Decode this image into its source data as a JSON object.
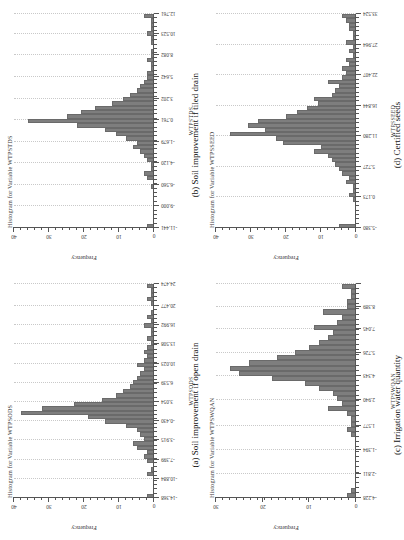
{
  "figure": {
    "panels": [
      {
        "key": "a",
        "title": "Histogram for Variable WTPSODS",
        "caption": "(a) Soil improvement if open drain",
        "chart_data": {
          "type": "bar",
          "title": "Histogram for Variable WTPSODS",
          "xlabel": "WTPSODS",
          "ylabel": "Frequency",
          "ylim": [
            0,
            40
          ],
          "yticks": [
            0,
            10,
            20,
            30,
            40
          ],
          "grid": true,
          "xlim": [
            -14.368,
            24.474
          ],
          "xticks": [
            -14.368,
            -10.884,
            -7.399,
            -3.915,
            -0.43,
            3.054,
            6.539,
            10.023,
            13.508,
            16.992,
            20.477,
            24.474
          ],
          "xticklabels": [
            "-14.368",
            "-10.884",
            "-7.399",
            "-3.915",
            "-0.430",
            "3.054",
            "6.539",
            "10.023",
            "13.508",
            "16.992",
            "20.477",
            "24.474"
          ],
          "categories": [
            "-14.2",
            "-13.4",
            "-12.6",
            "-11.8",
            "-11.0",
            "-10.2",
            "-9.4",
            "-8.6",
            "-7.8",
            "-7.0",
            "-6.2",
            "-5.4",
            "-4.6",
            "-3.8",
            "-3.0",
            "-2.2",
            "-1.4",
            "-0.6",
            "0.2",
            "1.0",
            "1.8",
            "2.6",
            "3.4",
            "4.2",
            "5.0",
            "5.8",
            "6.6",
            "7.4",
            "8.2",
            "9.0",
            "9.8",
            "10.6",
            "11.4",
            "12.2",
            "13.0",
            "13.8",
            "14.6",
            "15.4",
            "16.2",
            "17.0",
            "17.8",
            "18.6",
            "19.4",
            "20.2",
            "21.0",
            "21.8",
            "22.6",
            "23.4",
            "24.2"
          ],
          "values": [
            2,
            0,
            0,
            0,
            0,
            2,
            1,
            0,
            2,
            3,
            2,
            5,
            6,
            3,
            4,
            5,
            8,
            14,
            19,
            38,
            32,
            23,
            15,
            11,
            9,
            7,
            6,
            5,
            4,
            3,
            5,
            3,
            2,
            3,
            2,
            1,
            2,
            1,
            1,
            3,
            1,
            2,
            1,
            0,
            1,
            2,
            1,
            1,
            2
          ]
        }
      },
      {
        "key": "b",
        "title": "Histogram for Variable WTPSTDS",
        "caption": "(b) Soil improvement if tiled drain",
        "chart_data": {
          "type": "bar",
          "title": "Histogram for Variable WTPSTDS",
          "xlabel": "WTPSTDS",
          "ylabel": "Frequency",
          "ylim": [
            0,
            40
          ],
          "yticks": [
            0,
            10,
            20,
            30,
            40
          ],
          "grid": true,
          "xlim": [
            -11.441,
            12.761
          ],
          "xticks": [
            -11.441,
            -9.0,
            -6.56,
            -4.12,
            -1.679,
            0.761,
            3.202,
            5.642,
            8.082,
            10.523,
            12.761
          ],
          "xticklabels": [
            "-11.441",
            "-9.000",
            "-6.560",
            "-4.120",
            "-1.679",
            "0.761",
            "3.202",
            "5.642",
            "8.082",
            "10.523",
            "12.761"
          ],
          "categories": [
            "-11.2",
            "-10.7",
            "-10.2",
            "-9.7",
            "-9.2",
            "-8.7",
            "-8.2",
            "-7.7",
            "-7.2",
            "-6.7",
            "-6.2",
            "-5.7",
            "-5.2",
            "-4.7",
            "-4.2",
            "-3.7",
            "-3.2",
            "-2.7",
            "-2.2",
            "-1.7",
            "-1.2",
            "-0.7",
            "-0.2",
            "0.3",
            "0.8",
            "1.3",
            "1.8",
            "2.3",
            "2.8",
            "3.3",
            "3.8",
            "4.3",
            "4.8",
            "5.3",
            "5.8",
            "6.3",
            "6.8",
            "7.3",
            "7.8",
            "8.3",
            "8.8",
            "9.3",
            "9.8",
            "10.3",
            "10.8",
            "11.3",
            "11.8",
            "12.3",
            "12.7"
          ],
          "values": [
            2,
            0,
            0,
            0,
            0,
            0,
            0,
            0,
            0,
            1,
            0,
            2,
            3,
            1,
            1,
            2,
            3,
            4,
            6,
            5,
            8,
            11,
            14,
            22,
            36,
            25,
            21,
            17,
            12,
            9,
            7,
            5,
            4,
            3,
            2,
            2,
            1,
            1,
            2,
            1,
            1,
            0,
            1,
            1,
            2,
            1,
            1,
            1,
            3
          ]
        }
      },
      {
        "key": "c",
        "title": "Histogram for Variable WTPSWQAN",
        "caption": "(c) Irrigation water quantity",
        "chart_data": {
          "type": "bar",
          "title": "Histogram for Variable WTPSWQAN",
          "xlabel": "WTPSWQAN",
          "ylabel": "Frequency",
          "ylim": [
            0,
            30
          ],
          "yticks": [
            0,
            10,
            20,
            30
          ],
          "grid": true,
          "xlim": [
            -4.228,
            8.389
          ],
          "xticks": [
            -4.228,
            -2.811,
            -1.394,
            0.023,
            1.577,
            2.94,
            4.343,
            5.726,
            7.045,
            8.389
          ],
          "xticklabels": [
            "-4.228",
            "-2.811",
            "-1.394",
            "1.577",
            "2.940",
            "4.343",
            "5.726",
            "7.045",
            "8.389"
          ],
          "categories": [
            "-4.1",
            "-3.8",
            "-3.5",
            "-3.2",
            "-2.9",
            "-2.6",
            "-2.3",
            "-2.0",
            "-1.7",
            "-1.4",
            "-1.1",
            "-0.8",
            "-0.5",
            "-0.2",
            "0.1",
            "0.4",
            "0.7",
            "1.0",
            "1.3",
            "1.6",
            "1.9",
            "2.2",
            "2.5",
            "2.8",
            "3.1",
            "3.4",
            "3.7",
            "4.0",
            "4.3",
            "4.6",
            "4.9",
            "5.2",
            "5.5",
            "5.8",
            "6.1",
            "6.4",
            "6.7",
            "7.0",
            "7.3",
            "7.6",
            "7.9",
            "8.2"
          ],
          "values": [
            2,
            1,
            0,
            0,
            0,
            0,
            0,
            0,
            0,
            0,
            0,
            0,
            1,
            2,
            1,
            1,
            2,
            6,
            3,
            4,
            5,
            8,
            11,
            18,
            25,
            27,
            23,
            17,
            13,
            10,
            8,
            6,
            5,
            9,
            4,
            3,
            7,
            2,
            2,
            1,
            1,
            3
          ]
        }
      },
      {
        "key": "d",
        "title": "Histogram for Variable WTPSSEED",
        "caption": "(d) Certified seeds",
        "chart_data": {
          "type": "bar",
          "title": "Histogram for Variable WTPSSEED",
          "xlabel": "WTPSSEED",
          "ylabel": "Frequency",
          "ylim": [
            0,
            40
          ],
          "yticks": [
            0,
            10,
            20,
            30,
            40
          ],
          "grid": true,
          "xlim": [
            -5.38,
            33.524
          ],
          "xticks": [
            -5.38,
            0.173,
            5.727,
            11.28,
            16.844,
            22.407,
            27.964,
            33.524
          ],
          "xticklabels": [
            "-5.380",
            "0.173",
            "5.727",
            "11.280",
            "16.844",
            "22.407",
            "27.964",
            "33.524"
          ],
          "categories": [
            "-5.0",
            "-4.2",
            "-3.4",
            "-2.6",
            "-1.8",
            "-1.0",
            "-0.2",
            "0.6",
            "1.4",
            "2.2",
            "3.0",
            "3.8",
            "4.6",
            "5.4",
            "6.2",
            "7.0",
            "7.8",
            "8.6",
            "9.4",
            "10.2",
            "11.0",
            "11.8",
            "12.6",
            "13.4",
            "14.2",
            "15.0",
            "15.8",
            "16.6",
            "17.4",
            "18.2",
            "19.0",
            "19.8",
            "20.6",
            "21.4",
            "22.2",
            "23.0",
            "23.8",
            "24.6",
            "25.4",
            "26.2",
            "27.0",
            "27.8",
            "28.6",
            "29.4",
            "30.2",
            "31.0",
            "31.8",
            "32.6",
            "33.4"
          ],
          "values": [
            5,
            0,
            0,
            0,
            0,
            0,
            1,
            2,
            1,
            1,
            3,
            2,
            4,
            5,
            6,
            7,
            8,
            12,
            10,
            21,
            23,
            36,
            26,
            31,
            28,
            20,
            17,
            14,
            11,
            12,
            7,
            6,
            5,
            8,
            4,
            3,
            4,
            2,
            3,
            1,
            2,
            1,
            3,
            1,
            1,
            2,
            2,
            3,
            4
          ]
        }
      }
    ]
  },
  "style": {
    "bar_color": "#7e7e7e",
    "bar_edge_color": "#6a6a6a",
    "axis_color": "#555555",
    "grid_color": "#c9c9c9"
  }
}
